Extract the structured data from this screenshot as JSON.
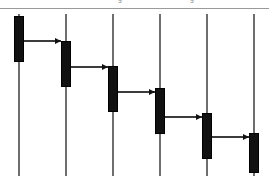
{
  "diagram": {
    "type": "uml-sequence-diagram",
    "title": "",
    "canvas": {
      "width": 269,
      "height": 189,
      "background": "#ffffff"
    },
    "header_rule": {
      "y": 8,
      "color": "#9a9a9a"
    },
    "clipped_header_labels": [
      {
        "text": "g",
        "x": 118
      },
      {
        "text": "g",
        "x": 190
      }
    ],
    "colors": {
      "lifeline": "#6e6e6e",
      "activation_fill": "#111111",
      "activation_stroke": "#000000",
      "message": "#3c3c3c",
      "arrowhead": "#111111",
      "rule": "#9a9a9a"
    },
    "lifelines": [
      {
        "id": "lifeline-1",
        "label": "",
        "x": 19,
        "top": 14,
        "bottom": 176
      },
      {
        "id": "lifeline-2",
        "label": "",
        "x": 66,
        "top": 14,
        "bottom": 176
      },
      {
        "id": "lifeline-3",
        "label": "",
        "x": 113,
        "top": 14,
        "bottom": 176
      },
      {
        "id": "lifeline-4",
        "label": "",
        "x": 160,
        "top": 14,
        "bottom": 176
      },
      {
        "id": "lifeline-5",
        "label": "",
        "x": 207,
        "top": 14,
        "bottom": 176
      },
      {
        "id": "lifeline-6",
        "label": "",
        "x": 254,
        "top": 14,
        "bottom": 176
      }
    ],
    "activations": [
      {
        "id": "activation-1",
        "lifeline": "lifeline-1",
        "x": 14,
        "y": 16,
        "width": 10,
        "height": 46
      },
      {
        "id": "activation-2",
        "lifeline": "lifeline-2",
        "x": 61,
        "y": 41,
        "width": 10,
        "height": 46
      },
      {
        "id": "activation-3",
        "lifeline": "lifeline-3",
        "x": 108,
        "y": 66,
        "width": 10,
        "height": 46
      },
      {
        "id": "activation-4",
        "lifeline": "lifeline-4",
        "x": 155,
        "y": 88,
        "width": 10,
        "height": 46
      },
      {
        "id": "activation-5",
        "lifeline": "lifeline-5",
        "x": 202,
        "y": 113,
        "width": 10,
        "height": 46
      },
      {
        "id": "activation-6",
        "lifeline": "lifeline-6",
        "x": 249,
        "y": 133,
        "width": 10,
        "height": 40
      }
    ],
    "messages": [
      {
        "id": "message-1",
        "label": "",
        "from": "lifeline-1",
        "to": "lifeline-2",
        "y": 41,
        "x_start": 24,
        "x_end": 61,
        "direction": "right"
      },
      {
        "id": "message-2",
        "label": "",
        "from": "lifeline-2",
        "to": "lifeline-3",
        "y": 67,
        "x_start": 71,
        "x_end": 108,
        "direction": "right"
      },
      {
        "id": "message-3",
        "label": "",
        "from": "lifeline-3",
        "to": "lifeline-4",
        "y": 92,
        "x_start": 118,
        "x_end": 155,
        "direction": "right"
      },
      {
        "id": "message-4",
        "label": "",
        "from": "lifeline-4",
        "to": "lifeline-5",
        "y": 117,
        "x_start": 165,
        "x_end": 202,
        "direction": "right"
      },
      {
        "id": "message-5",
        "label": "",
        "from": "lifeline-5",
        "to": "lifeline-6",
        "y": 137,
        "x_start": 212,
        "x_end": 249,
        "direction": "right"
      }
    ]
  }
}
